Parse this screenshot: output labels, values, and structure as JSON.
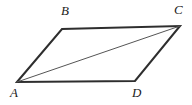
{
  "figure": {
    "type": "parallelogram-with-diagonal",
    "background_color": "#ffffff",
    "stroke_color": "#2e2e2e",
    "diagonal_color": "#555555",
    "side_stroke_width": 2,
    "diagonal_stroke_width": 1,
    "vertices": [
      {
        "name": "A",
        "label": "A",
        "x": 17,
        "y": 82
      },
      {
        "name": "B",
        "label": "B",
        "x": 62,
        "y": 29
      },
      {
        "name": "C",
        "label": "C",
        "x": 180,
        "y": 26
      },
      {
        "name": "D",
        "label": "D",
        "x": 135,
        "y": 81
      }
    ],
    "sides": [
      {
        "name": "side-AB",
        "from": "A",
        "to": "B"
      },
      {
        "name": "side-BC",
        "from": "B",
        "to": "C"
      },
      {
        "name": "side-CD",
        "from": "C",
        "to": "D"
      },
      {
        "name": "side-DA",
        "from": "D",
        "to": "A"
      }
    ],
    "diagonal": {
      "name": "diagonal-AC",
      "from": "A",
      "to": "C"
    },
    "outline_points": "17,82 62,29 180,26 135,81",
    "diagonal_points": {
      "x1": 17,
      "y1": 82,
      "x2": 180,
      "y2": 26
    },
    "labels": {
      "A": "A",
      "B": "B",
      "C": "C",
      "D": "D"
    }
  }
}
